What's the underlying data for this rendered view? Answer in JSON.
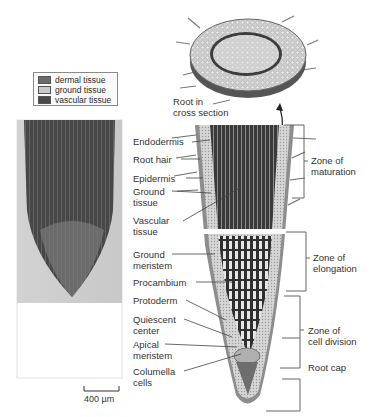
{
  "legend": {
    "items": [
      {
        "label": "dermal tissue",
        "color": "#6b6b6b"
      },
      {
        "label": "ground tissue",
        "color": "#c9c9c9"
      },
      {
        "label": "vascular tissue",
        "color": "#4a4a4a"
      }
    ]
  },
  "micrograph": {
    "scale_bar_label": "400 µm"
  },
  "cross_section": {
    "label_line1": "Root in",
    "label_line2": "cross section"
  },
  "left_labels": [
    {
      "line1": "Endodermis",
      "line2": ""
    },
    {
      "line1": "Root hair",
      "line2": ""
    },
    {
      "line1": "Epidermis",
      "line2": ""
    },
    {
      "line1": "Ground",
      "line2": "tissue"
    },
    {
      "line1": "Vascular",
      "line2": "tissue"
    },
    {
      "line1": "Ground",
      "line2": "meristem"
    },
    {
      "line1": "Procambium",
      "line2": ""
    },
    {
      "line1": "Protoderm",
      "line2": ""
    },
    {
      "line1": "Quiescent",
      "line2": "center"
    },
    {
      "line1": "Apical",
      "line2": "meristem"
    },
    {
      "line1": "Columella",
      "line2": "cells"
    }
  ],
  "zones": [
    {
      "line1": "Zone of",
      "line2": "maturation"
    },
    {
      "line1": "Zone of",
      "line2": "elongation"
    },
    {
      "line1": "Zone of",
      "line2": "cell division"
    },
    {
      "line1": "Root cap",
      "line2": ""
    }
  ]
}
